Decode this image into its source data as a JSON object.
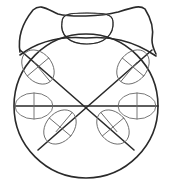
{
  "diagram": {
    "colors": {
      "stroke": "#2a2a2a",
      "thin_stroke": "#6a6a6a",
      "dotted_stroke": "#8a8a8a",
      "background": "#ffffff"
    },
    "circle": {
      "cx": 86,
      "cy": 106,
      "r": 72
    },
    "lines": [
      {
        "name": "horizontal",
        "x1": 15,
        "y1": 106,
        "x2": 158,
        "y2": 106
      },
      {
        "name": "diagonal-left-to-right",
        "x1": 20,
        "y1": 50,
        "x2": 134,
        "y2": 150
      },
      {
        "name": "diagonal-right-to-left",
        "x1": 152,
        "y1": 50,
        "x2": 38,
        "y2": 150
      }
    ],
    "ovals": [
      {
        "name": "upper-left",
        "cx": 38,
        "cy": 67,
        "rx": 14,
        "ry": 19,
        "rotate": -40
      },
      {
        "name": "upper-right",
        "cx": 133,
        "cy": 67,
        "rx": 14,
        "ry": 19,
        "rotate": 40
      },
      {
        "name": "middle-left",
        "cx": 34,
        "cy": 106,
        "rx": 19,
        "ry": 13,
        "rotate": 0
      },
      {
        "name": "middle-right",
        "cx": 137,
        "cy": 106,
        "rx": 19,
        "ry": 13,
        "rotate": 0
      },
      {
        "name": "lower-left",
        "cx": 60,
        "cy": 127,
        "rx": 14,
        "ry": 19,
        "rotate": 40
      },
      {
        "name": "lower-right",
        "cx": 113,
        "cy": 127,
        "rx": 14,
        "ry": 19,
        "rotate": -40
      }
    ],
    "cap_inner_oval": {
      "cx": 87,
      "cy": 28,
      "rx": 30,
      "ry": 18
    }
  }
}
